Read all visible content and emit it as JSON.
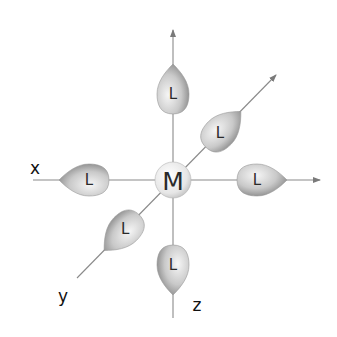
{
  "diagram": {
    "type": "octahedral-coordination",
    "center_atom": {
      "label": "M",
      "x": 173,
      "y": 180,
      "r": 18
    },
    "axes": [
      {
        "name": "z-up",
        "x1": 173,
        "y1": 318,
        "x2": 173,
        "y2": 30,
        "arrow": true
      },
      {
        "name": "x",
        "x1": 33,
        "y1": 180,
        "x2": 320,
        "y2": 180,
        "arrow": true
      },
      {
        "name": "y",
        "x1": 77,
        "y1": 278,
        "x2": 276,
        "y2": 75,
        "arrow": true
      }
    ],
    "axis_labels": {
      "x": "x",
      "y": "y",
      "z": "z"
    },
    "ligand_label": "L",
    "ligands": [
      {
        "id": "top",
        "label": "L"
      },
      {
        "id": "upper-right",
        "label": "L"
      },
      {
        "id": "right",
        "label": "L"
      },
      {
        "id": "left",
        "label": "L"
      },
      {
        "id": "lower-left",
        "label": "L"
      },
      {
        "id": "bottom",
        "label": "L"
      }
    ],
    "colors": {
      "background": "#ffffff",
      "axis": "#8a8a8a",
      "lobe_light": "#f4f4f4",
      "lobe_dark": "#8c8c8c",
      "sphere_light": "#ffffff",
      "sphere_dark": "#c8c8c8",
      "text": "#2a2a2a"
    }
  }
}
